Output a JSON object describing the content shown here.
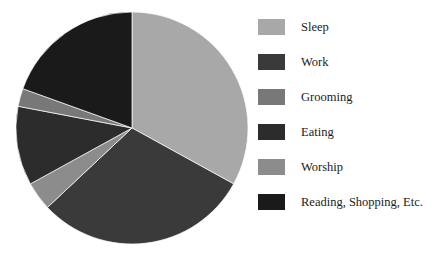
{
  "chart_data": {
    "type": "pie",
    "title": "",
    "subtitle": "",
    "xlabel": "",
    "ylabel": "",
    "grid": false,
    "legend_position": "right",
    "start_angle_deg": 0,
    "direction": "clockwise",
    "categories": [
      "Sleep",
      "Work",
      "Grooming",
      "Eating",
      "Worship",
      "Reading, Shopping, Etc."
    ],
    "values": [
      33,
      30,
      2.5,
      11,
      4,
      19.5
    ],
    "units": "percent",
    "slices": [
      {
        "label": "Sleep",
        "value": 33,
        "color": "#a8a8a8",
        "start_deg": 0,
        "end_deg": 118.8
      },
      {
        "label": "Work",
        "value": 30,
        "color": "#3a3a3a",
        "start_deg": 118.8,
        "end_deg": 226.8
      },
      {
        "label": "Worship",
        "value": 4,
        "color": "#8c8c8c",
        "start_deg": 226.8,
        "end_deg": 241.2
      },
      {
        "label": "Eating",
        "value": 11,
        "color": "#2c2c2c",
        "start_deg": 241.2,
        "end_deg": 280.8
      },
      {
        "label": "Grooming",
        "value": 2.5,
        "color": "#787878",
        "start_deg": 280.8,
        "end_deg": 289.8
      },
      {
        "label": "Reading, Shopping, Etc.",
        "value": 19.5,
        "color": "#1a1a1a",
        "start_deg": 289.8,
        "end_deg": 360
      }
    ]
  },
  "legend": {
    "items": [
      {
        "label": "Sleep",
        "color": "#a8a8a8"
      },
      {
        "label": "Work",
        "color": "#3a3a3a"
      },
      {
        "label": "Grooming",
        "color": "#787878"
      },
      {
        "label": "Eating",
        "color": "#2c2c2c"
      },
      {
        "label": "Worship",
        "color": "#8c8c8c"
      },
      {
        "label": "Reading, Shopping, Etc.",
        "color": "#1a1a1a"
      }
    ]
  }
}
